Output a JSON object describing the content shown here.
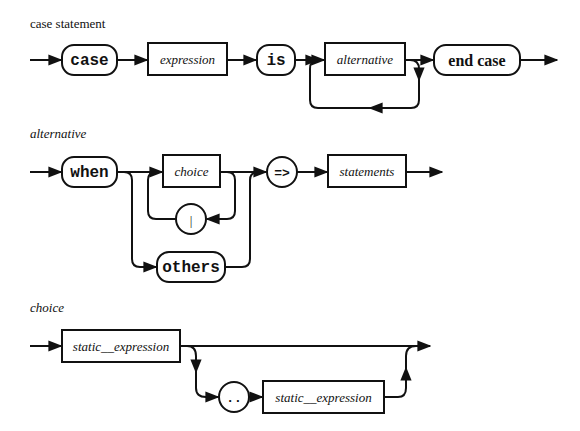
{
  "diagrams": [
    {
      "title": "case statement",
      "elements": [
        {
          "kind": "terminal",
          "label": "case"
        },
        {
          "kind": "nonterminal",
          "label": "expression"
        },
        {
          "kind": "terminal",
          "label": "is"
        },
        {
          "kind": "nonterminal",
          "label": "alternative",
          "repeat": true
        },
        {
          "kind": "terminal",
          "label": "end case"
        }
      ]
    },
    {
      "title": "alternative",
      "elements": [
        {
          "kind": "terminal",
          "label": "when"
        },
        {
          "kind": "nonterminal",
          "label": "choice"
        },
        {
          "kind": "terminal",
          "label": "|"
        },
        {
          "kind": "terminal",
          "label": "others"
        },
        {
          "kind": "terminal",
          "label": "=>"
        },
        {
          "kind": "nonterminal",
          "label": "statements"
        }
      ]
    },
    {
      "title": "choice",
      "elements": [
        {
          "kind": "nonterminal",
          "label": "static__expression"
        },
        {
          "kind": "terminal",
          "label": ".."
        },
        {
          "kind": "nonterminal",
          "label": "static__expression"
        }
      ]
    }
  ]
}
